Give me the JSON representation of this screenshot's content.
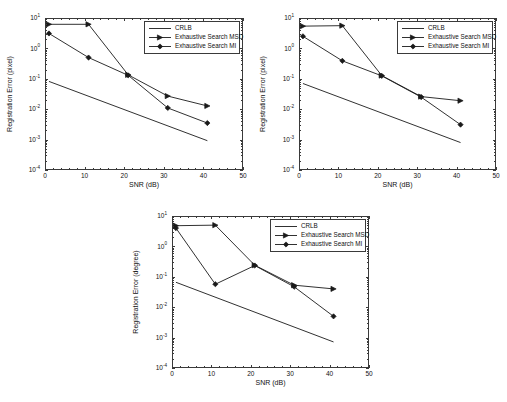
{
  "figure": {
    "caption": ""
  },
  "legend": {
    "entries": [
      {
        "label": "CRLB",
        "marker": "line"
      },
      {
        "label": "Exhaustive Search MSD",
        "marker": "triangle-right"
      },
      {
        "label": "Exhaustive Search MI",
        "marker": "diamond"
      }
    ]
  },
  "axis": {
    "xlabel": "SNR (dB)",
    "xticks": [
      "0",
      "10",
      "20",
      "30",
      "40",
      "50"
    ],
    "yticks": [
      "10",
      "10",
      "10",
      "10",
      "10",
      "10"
    ],
    "yexps": [
      "1",
      "0",
      "-1",
      "-2",
      "-3",
      "-4"
    ]
  },
  "chart_data": [
    {
      "id": "chart-top-left",
      "type": "line",
      "title": "",
      "xlabel": "SNR (dB)",
      "ylabel": "Registration Error (pixel)",
      "xlim": [
        0,
        50
      ],
      "ylim": [
        0.0001,
        10
      ],
      "yscale": "log",
      "grid": false,
      "legend_position": "top-right",
      "x": [
        1,
        11,
        21,
        31,
        41
      ],
      "series": [
        {
          "name": "CRLB",
          "marker": "none",
          "x": [
            1,
            41
          ],
          "values": [
            0.082,
            0.00092
          ]
        },
        {
          "name": "Exhaustive Search MSD",
          "marker": "triangle-right",
          "values": [
            6.2,
            6.2,
            0.135,
            0.027,
            0.0128
          ]
        },
        {
          "name": "Exhaustive Search MI",
          "marker": "diamond",
          "values": [
            3.1,
            0.5,
            0.13,
            0.011,
            0.0035
          ]
        }
      ]
    },
    {
      "id": "chart-top-right",
      "type": "line",
      "title": "",
      "xlabel": "SNR (dB)",
      "ylabel": "Registration Error (pixel)",
      "xlim": [
        0,
        50
      ],
      "ylim": [
        0.0001,
        10
      ],
      "yscale": "log",
      "grid": false,
      "legend_position": "top-right",
      "x": [
        1,
        11,
        21,
        31,
        41
      ],
      "series": [
        {
          "name": "CRLB",
          "marker": "none",
          "x": [
            1,
            41
          ],
          "values": [
            0.07,
            0.0008
          ]
        },
        {
          "name": "Exhaustive Search MSD",
          "marker": "triangle-right",
          "values": [
            5.4,
            5.6,
            0.128,
            0.026,
            0.019
          ]
        },
        {
          "name": "Exhaustive Search MI",
          "marker": "diamond",
          "values": [
            2.5,
            0.39,
            0.125,
            0.025,
            0.0031
          ]
        }
      ]
    },
    {
      "id": "chart-bottom",
      "type": "line",
      "title": "",
      "xlabel": "SNR (dB)",
      "ylabel": "Registration Error (degree)",
      "xlim": [
        0,
        50
      ],
      "ylim": [
        0.0001,
        10
      ],
      "yscale": "log",
      "grid": false,
      "legend_position": "top-right",
      "x": [
        1,
        11,
        21,
        31,
        41
      ],
      "series": [
        {
          "name": "CRLB",
          "marker": "none",
          "x": [
            1,
            41
          ],
          "values": [
            0.066,
            0.00072
          ]
        },
        {
          "name": "Exhaustive Search MSD",
          "marker": "triangle-right",
          "values": [
            4.8,
            5.0,
            0.24,
            0.053,
            0.04
          ]
        },
        {
          "name": "Exhaustive Search MI",
          "marker": "diamond",
          "values": [
            4.0,
            0.057,
            0.235,
            0.047,
            0.005
          ]
        }
      ]
    }
  ]
}
